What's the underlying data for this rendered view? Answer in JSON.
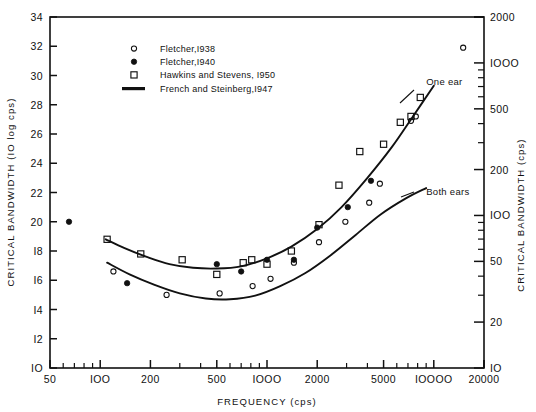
{
  "chart_data": {
    "type": "scatter",
    "title": "",
    "xlabel": "FREQUENCY (cps)",
    "ylabel": "CRITICAL BANDWIDTH (IO log cps)",
    "ylabel_right": "CRITICAL  BANDWIDTH (cps)",
    "xscale": "log",
    "xlim": [
      50,
      20000
    ],
    "ylim": [
      10,
      34
    ],
    "yscale_right": "log",
    "ylim_right": [
      10,
      2000
    ],
    "grid": false,
    "legend_position": "upper-left-inside",
    "xticks": [
      50,
      100,
      200,
      500,
      1000,
      2000,
      5000,
      10000,
      20000
    ],
    "xticklabels": [
      "50",
      "IOO",
      "200",
      "500",
      "IOOO",
      "2000",
      "5000",
      "IOOOO",
      "20000"
    ],
    "yticks": [
      10,
      12,
      14,
      16,
      18,
      20,
      22,
      24,
      26,
      28,
      30,
      32,
      34
    ],
    "yticklabels": [
      "IO",
      "I2",
      "I4",
      "I6",
      "I8",
      "20",
      "22",
      "24",
      "26",
      "28",
      "30",
      "32",
      "34"
    ],
    "yticks_right": [
      10,
      20,
      50,
      100,
      200,
      500,
      1000,
      2000
    ],
    "yticklabels_right": [
      "IO",
      "20",
      "50",
      "IOO",
      "200",
      "500",
      "IOOO",
      "2000"
    ],
    "legend": [
      {
        "marker": "open-circle",
        "label": "Fletcher,I938"
      },
      {
        "marker": "filled-circle",
        "label": "Fletcher,I940"
      },
      {
        "marker": "open-square",
        "label": "Hawkins and Stevens, I950"
      },
      {
        "marker": "line",
        "label": "French and Steinberg,I947"
      }
    ],
    "annotations": [
      {
        "text": "One ear",
        "x": 9000,
        "y": 29.6
      },
      {
        "text": "Both ears",
        "x": 9000,
        "y": 22.1
      }
    ],
    "series": [
      {
        "name": "Fletcher,I938",
        "marker": "open-circle",
        "points": [
          {
            "x": 120,
            "y": 16.6
          },
          {
            "x": 250,
            "y": 15.0
          },
          {
            "x": 520,
            "y": 15.1
          },
          {
            "x": 820,
            "y": 15.6
          },
          {
            "x": 1050,
            "y": 16.1
          },
          {
            "x": 1450,
            "y": 17.2
          },
          {
            "x": 2050,
            "y": 18.6
          },
          {
            "x": 2950,
            "y": 20.0
          },
          {
            "x": 4100,
            "y": 21.3
          },
          {
            "x": 4750,
            "y": 22.6
          },
          {
            "x": 7300,
            "y": 26.9
          },
          {
            "x": 7800,
            "y": 27.2
          },
          {
            "x": 15000,
            "y": 31.9
          }
        ]
      },
      {
        "name": "Fletcher,I940",
        "marker": "filled-circle",
        "points": [
          {
            "x": 65,
            "y": 20.0
          },
          {
            "x": 145,
            "y": 15.8
          },
          {
            "x": 500,
            "y": 17.1
          },
          {
            "x": 700,
            "y": 16.6
          },
          {
            "x": 1000,
            "y": 17.4
          },
          {
            "x": 1450,
            "y": 17.4
          },
          {
            "x": 2000,
            "y": 19.6
          },
          {
            "x": 3050,
            "y": 21.0
          },
          {
            "x": 4200,
            "y": 22.8
          }
        ]
      },
      {
        "name": "Hawkins and Stevens, I950",
        "marker": "open-square",
        "points": [
          {
            "x": 110,
            "y": 18.8
          },
          {
            "x": 175,
            "y": 17.8
          },
          {
            "x": 310,
            "y": 17.4
          },
          {
            "x": 500,
            "y": 16.4
          },
          {
            "x": 720,
            "y": 17.2
          },
          {
            "x": 810,
            "y": 17.4
          },
          {
            "x": 1000,
            "y": 17.1
          },
          {
            "x": 1400,
            "y": 18.0
          },
          {
            "x": 2050,
            "y": 19.8
          },
          {
            "x": 2700,
            "y": 22.5
          },
          {
            "x": 3600,
            "y": 24.8
          },
          {
            "x": 5000,
            "y": 25.3
          },
          {
            "x": 6300,
            "y": 26.8
          },
          {
            "x": 7300,
            "y": 27.2
          },
          {
            "x": 8300,
            "y": 28.5
          }
        ]
      }
    ],
    "curves": [
      {
        "name": "One ear",
        "style": "solid",
        "points": [
          {
            "x": 108,
            "y": 18.8
          },
          {
            "x": 140,
            "y": 18.2
          },
          {
            "x": 190,
            "y": 17.6
          },
          {
            "x": 260,
            "y": 17.1
          },
          {
            "x": 360,
            "y": 16.85
          },
          {
            "x": 500,
            "y": 16.8
          },
          {
            "x": 700,
            "y": 16.95
          },
          {
            "x": 1000,
            "y": 17.5
          },
          {
            "x": 1400,
            "y": 18.3
          },
          {
            "x": 2000,
            "y": 19.5
          },
          {
            "x": 2800,
            "y": 21.0
          },
          {
            "x": 4000,
            "y": 23.0
          },
          {
            "x": 5600,
            "y": 25.1
          },
          {
            "x": 7500,
            "y": 27.2
          },
          {
            "x": 10000,
            "y": 29.3
          }
        ]
      },
      {
        "name": "Both ears",
        "style": "solid",
        "points": [
          {
            "x": 110,
            "y": 17.2
          },
          {
            "x": 150,
            "y": 16.4
          },
          {
            "x": 210,
            "y": 15.7
          },
          {
            "x": 300,
            "y": 15.1
          },
          {
            "x": 430,
            "y": 14.75
          },
          {
            "x": 600,
            "y": 14.7
          },
          {
            "x": 850,
            "y": 14.95
          },
          {
            "x": 1200,
            "y": 15.6
          },
          {
            "x": 1700,
            "y": 16.5
          },
          {
            "x": 2400,
            "y": 17.7
          },
          {
            "x": 3400,
            "y": 19.1
          },
          {
            "x": 4800,
            "y": 20.5
          },
          {
            "x": 6800,
            "y": 21.6
          },
          {
            "x": 9000,
            "y": 22.3
          }
        ]
      }
    ]
  }
}
